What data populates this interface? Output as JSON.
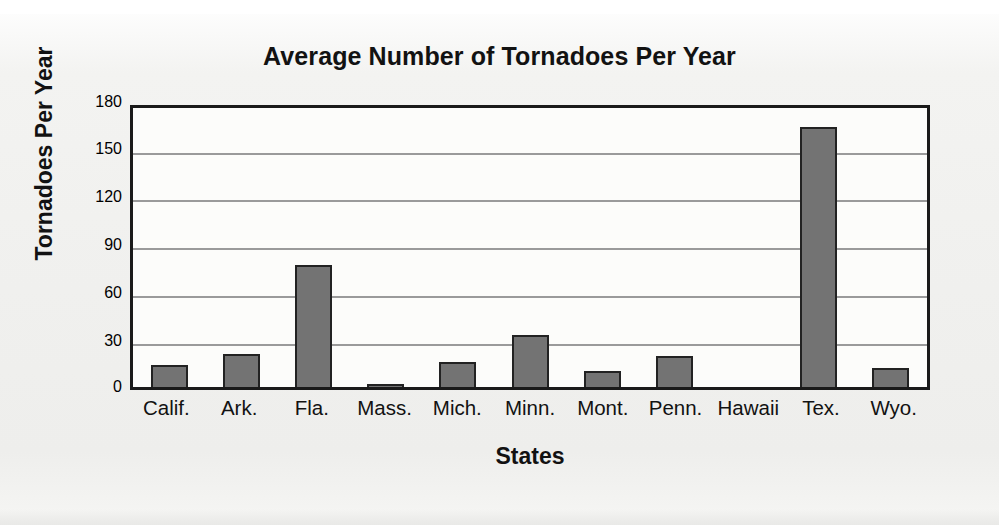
{
  "chart_data": {
    "type": "bar",
    "title": "Average Number of Tornadoes Per Year",
    "xlabel": "States",
    "ylabel": "Tornadoes Per Year",
    "categories": [
      "Calif.",
      "Ark.",
      "Fla.",
      "Mass.",
      "Mich.",
      "Minn.",
      "Mont.",
      "Penn.",
      "Hawaii",
      "Tex.",
      "Wyo."
    ],
    "values": [
      14,
      21,
      78,
      2,
      16,
      33,
      10,
      20,
      0,
      166,
      12
    ],
    "ylim": [
      0,
      180
    ],
    "yticks": [
      0,
      30,
      60,
      90,
      120,
      150,
      180
    ],
    "ytick_labels": [
      "0",
      "30",
      "60",
      "90",
      "120",
      "150",
      "180"
    ],
    "grid": true,
    "legend": false,
    "series_color": "#737373",
    "bar_outline_color": "#222222",
    "axis_color": "#1a1a1a",
    "gridline_color": "#9a9a9a",
    "plot_background": "#fcfcfa",
    "page_background": "#f0f0ee"
  }
}
